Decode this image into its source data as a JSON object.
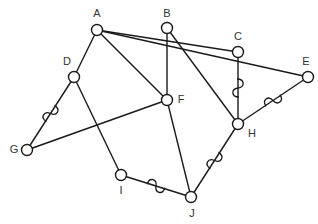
{
  "diagram": {
    "type": "graph",
    "nodes": [
      {
        "id": "A",
        "label": "A",
        "x": 97,
        "y": 30,
        "lx": 97,
        "ly": 14
      },
      {
        "id": "B",
        "label": "B",
        "x": 167,
        "y": 28,
        "lx": 167,
        "ly": 14
      },
      {
        "id": "C",
        "label": "C",
        "x": 238,
        "y": 52,
        "lx": 238,
        "ly": 37
      },
      {
        "id": "D",
        "label": "D",
        "x": 74,
        "y": 77,
        "lx": 67,
        "ly": 62
      },
      {
        "id": "E",
        "label": "E",
        "x": 308,
        "y": 77,
        "lx": 306,
        "ly": 62
      },
      {
        "id": "F",
        "label": "F",
        "x": 167,
        "y": 100,
        "lx": 181,
        "ly": 100
      },
      {
        "id": "G",
        "label": "G",
        "x": 27,
        "y": 150,
        "lx": 14,
        "ly": 150
      },
      {
        "id": "H",
        "label": "H",
        "x": 238,
        "y": 124,
        "lx": 252,
        "ly": 134
      },
      {
        "id": "I",
        "label": "I",
        "x": 121,
        "y": 175,
        "lx": 121,
        "ly": 191
      },
      {
        "id": "J",
        "label": "J",
        "x": 191,
        "y": 197,
        "lx": 192,
        "ly": 214
      }
    ],
    "edges": [
      {
        "from": "A",
        "to": "D",
        "style": "straight"
      },
      {
        "from": "A",
        "to": "F",
        "style": "straight"
      },
      {
        "from": "A",
        "to": "C",
        "style": "straight"
      },
      {
        "from": "A",
        "to": "E",
        "style": "straight"
      },
      {
        "from": "B",
        "to": "F",
        "style": "straight"
      },
      {
        "from": "B",
        "to": "H",
        "style": "straight"
      },
      {
        "from": "C",
        "to": "H",
        "style": "wavy"
      },
      {
        "from": "D",
        "to": "G",
        "style": "wavy"
      },
      {
        "from": "D",
        "to": "I",
        "style": "straight"
      },
      {
        "from": "G",
        "to": "F",
        "style": "straight"
      },
      {
        "from": "E",
        "to": "H",
        "style": "wavy"
      },
      {
        "from": "F",
        "to": "J",
        "style": "straight"
      },
      {
        "from": "I",
        "to": "J",
        "style": "wavy"
      },
      {
        "from": "H",
        "to": "J",
        "style": "wavy"
      }
    ],
    "colors": {
      "line": "#1a1a1a",
      "node_fill": "#ffffff",
      "label": "#333333"
    },
    "node_radius": 5.5
  }
}
